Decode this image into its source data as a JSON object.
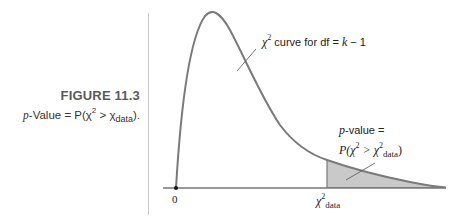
{
  "caption": {
    "figure_number": "FIGURE 11.3",
    "text_prefix": "p",
    "text_main": "-Value = P(χ",
    "text_sup": "2",
    "text_gt": " > χ",
    "text_sub": "data",
    "text_end": ")."
  },
  "curve_label": {
    "symbol": "χ",
    "sup": "2",
    "text": " curve for df = ",
    "k": "k",
    "rest": " − 1"
  },
  "pvalue_label": {
    "line1_p": "p",
    "line1_rest": "-value =",
    "line2_pre": "P(χ",
    "line2_sup": "2",
    "line2_gt": " > χ",
    "line2_sup2": "2",
    "line2_sub": "data",
    "line2_end": ")"
  },
  "axis": {
    "origin_label": "0",
    "chi_data_symbol": "χ",
    "chi_data_sup": "2",
    "chi_data_sub": "data"
  },
  "colors": {
    "curve": "#7a7a7a",
    "shade": "#c9c9c9",
    "axis": "#333333",
    "divider": "#c8c8c8"
  }
}
